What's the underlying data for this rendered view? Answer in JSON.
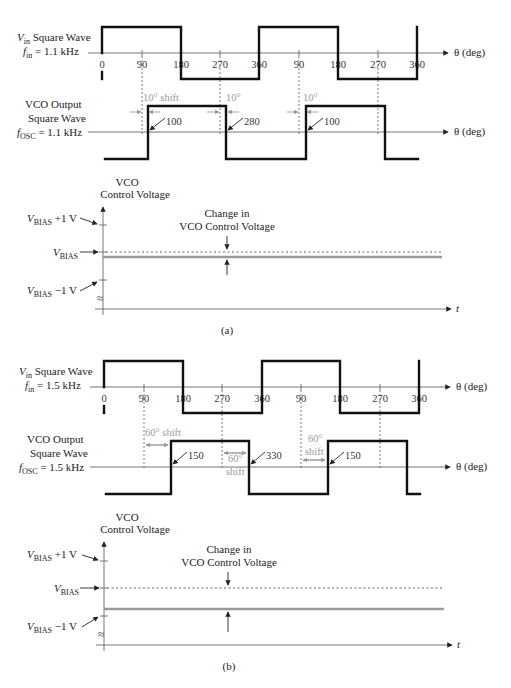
{
  "figure_a": {
    "caption": "(a)",
    "vin": {
      "name": "V",
      "sub": "in",
      "rest": " Square Wave",
      "freq_f": "f",
      "freq_sub": "in",
      "freq_val": " = 1.1 kHz"
    },
    "ticks": [
      "0",
      "90",
      "180",
      "270",
      "360",
      "90",
      "180",
      "270",
      "360"
    ],
    "theta_label": "θ (deg)",
    "vco": {
      "line1": "VCO Output",
      "line2": "Square Wave",
      "freq_f": "f",
      "freq_sub": "OSC",
      "freq_val": " = 1.1 kHz"
    },
    "shift1": "10° shift",
    "shift2": "10°",
    "shift3": "10°",
    "edge1": "100",
    "edge2": "280",
    "edge3": "100",
    "ctrl": {
      "title1": "VCO",
      "title2": "Control Voltage",
      "plus": " +1 V",
      "bias": "V",
      "bias_sub": "BIAS",
      "minus": " −1 V",
      "change1": "Change in",
      "change2": "VCO Control Voltage",
      "t_label": "t",
      "break": "≈"
    }
  },
  "figure_b": {
    "caption": "(b)",
    "vin": {
      "name": "V",
      "sub": "in",
      "rest": " Square Wave",
      "freq_f": "f",
      "freq_sub": "in",
      "freq_val": " = 1.5 kHz"
    },
    "ticks": [
      "0",
      "90",
      "180",
      "270",
      "360",
      "90",
      "180",
      "270",
      "360"
    ],
    "theta_label": "θ (deg)",
    "vco": {
      "line1": "VCO Output",
      "line2": "Square Wave",
      "freq_f": "f",
      "freq_sub": "OSC",
      "freq_val": " = 1.5 kHz"
    },
    "shift1": "60° shift",
    "shift2a": "60°",
    "shift2b": "shift",
    "shift3a": "60°",
    "shift3b": "shift",
    "edge1": "150",
    "edge2": "330",
    "edge3": "150",
    "ctrl": {
      "title1": "VCO",
      "title2": "Control Voltage",
      "plus": " +1 V",
      "bias": "V",
      "bias_sub": "BIAS",
      "minus": " −1 V",
      "change1": "Change in",
      "change2": "VCO Control Voltage",
      "t_label": "t",
      "break": "≈"
    }
  }
}
